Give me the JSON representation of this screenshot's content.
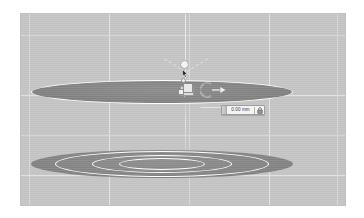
{
  "app": {
    "scene_type": "3d-cad-viewport"
  },
  "viewport": {
    "background_color": "#c6c6c6",
    "grid_color": "#d9d9d9",
    "grid_major_color": "#e6e6e6",
    "vertical_gridlines": [
      8,
      88,
      168,
      248,
      316
    ],
    "horizontal_gridlines": [
      21,
      81,
      121,
      161
    ],
    "surface_color": "#868686",
    "outline_color": "#ffffff"
  },
  "objects": {
    "top_disc": {
      "name": "cylinder-top-face",
      "fill": "#868686",
      "outline": "#ffffff"
    },
    "bottom_disc": {
      "name": "cylinder-bottom-face",
      "fill": "#868686"
    },
    "rings": [
      {
        "name": "concentric-ring-outer",
        "stroke": "#ffffff"
      },
      {
        "name": "concentric-ring-middle",
        "stroke": "#ffffff"
      },
      {
        "name": "concentric-ring-inner",
        "stroke": "#ffffff"
      }
    ]
  },
  "gizmo": {
    "name": "transform-gizmo",
    "handles": [
      "axis-sphere-handle",
      "axis-stem",
      "point-handle",
      "scale-square-handle",
      "move-square-handle",
      "rotation-arc-handle"
    ]
  },
  "dimension_field": {
    "name": "dimension-input",
    "value": "0.00 mm",
    "placeholder": "0.00 mm",
    "lock_icon": "lock-icon"
  }
}
